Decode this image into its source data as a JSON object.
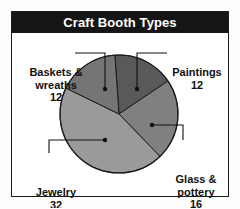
{
  "figure": {
    "title": "Craft Booth Types",
    "title_bar_color": "#151515",
    "title_text_color": "#ffffff",
    "background_color": "#ffffff",
    "border_color": "#1a1a1a"
  },
  "chart_data": {
    "type": "pie",
    "title": "Craft Booth Types",
    "xlabel": "",
    "ylabel": "",
    "total": 72,
    "start_angle_deg": -4,
    "direction": "clockwise",
    "grid": false,
    "legend": "none",
    "labels_position": "outside-with-leader-lines",
    "categories": [
      "Paintings",
      "Glass & pottery",
      "Jewelry",
      "Baskets & wreaths"
    ],
    "values": [
      12,
      16,
      32,
      12
    ],
    "colors": [
      "#595959",
      "#808080",
      "#9a9a9a",
      "#757575"
    ],
    "slices": [
      {
        "name": "Paintings",
        "label": "Paintings",
        "value": 12,
        "value_text": "12",
        "color": "#595959"
      },
      {
        "name": "Glass & pottery",
        "label_line1": "Glass &",
        "label_line2": "pottery",
        "value": 16,
        "value_text": "16",
        "color": "#808080"
      },
      {
        "name": "Jewelry",
        "label": "Jewelry",
        "value": 32,
        "value_text": "32",
        "color": "#9a9a9a"
      },
      {
        "name": "Baskets & wreaths",
        "label_line1": "Baskets &",
        "label_line2": "wreaths",
        "value": 12,
        "value_text": "12",
        "color": "#757575"
      }
    ]
  },
  "labels": {
    "baskets": {
      "line1": "Baskets &",
      "line2": "wreaths",
      "value": "12"
    },
    "paintings": {
      "line1": "Paintings",
      "value": "12"
    },
    "glass": {
      "line1": "Glass &",
      "line2": "pottery",
      "value": "16"
    },
    "jewelry": {
      "line1": "Jewelry",
      "value": "32"
    }
  }
}
